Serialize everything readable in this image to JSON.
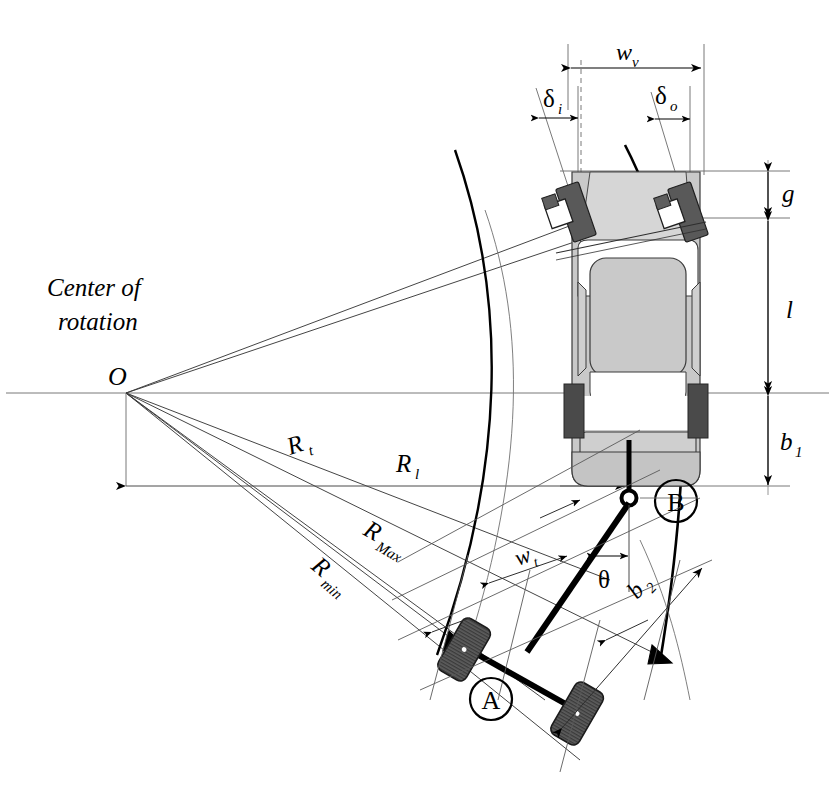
{
  "diagram": {
    "title_text": "Center of rotation",
    "domain": "vehicle-trailer turning geometry top view",
    "center_point_label": "O",
    "labels": {
      "center_of_rotation_line1": "Center of",
      "center_of_rotation_line2": "rotation",
      "origin": "O",
      "radius_t": "R",
      "radius_t_sub": "t",
      "radius_l": "R",
      "radius_l_sub": "l",
      "radius_max": "R",
      "radius_max_sub": "Max",
      "radius_min": "R",
      "radius_min_sub": "min",
      "vehicle_width": "w",
      "vehicle_width_sub": "v",
      "delta_inner": "δ",
      "delta_inner_sub": "i",
      "delta_outer": "δ",
      "delta_outer_sub": "o",
      "front_overhang": "g",
      "wheelbase": "l",
      "rear_overhang": "b",
      "rear_overhang_sub": "1",
      "trailer_width": "w",
      "trailer_width_sub": "t",
      "articulation_angle": "θ",
      "trailer_drawbar": "b",
      "trailer_drawbar_sub": "2",
      "point_a": "A",
      "point_b": "B"
    },
    "colors": {
      "line": "#000000",
      "thin_line": "#555555",
      "body_fill": "#c9c9c9",
      "body_light": "#d8d8d8",
      "window_white": "#ffffff",
      "wheel_dark": "#4a4a4a",
      "wheel_mid": "#6b6b6b",
      "background": "#ffffff"
    },
    "geometry": {
      "center_of_rotation_x": 126,
      "center_of_rotation_y": 393,
      "hitch_b_x": 629,
      "hitch_b_y": 498,
      "vehicle_rear_axle_y": 393,
      "image_width": 835,
      "image_height": 792
    }
  }
}
